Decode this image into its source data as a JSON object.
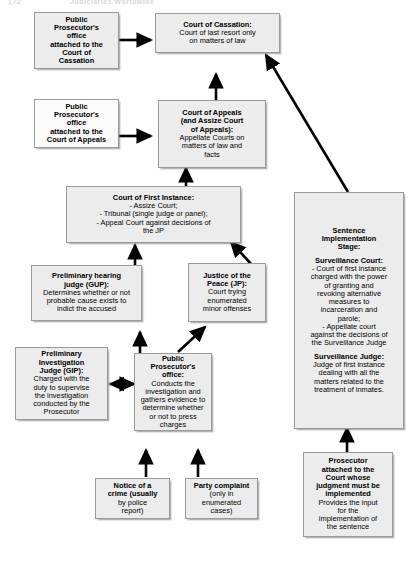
{
  "page": {
    "header_left": "172",
    "header_right": "Judiciaries Worldwide"
  },
  "boxes": [
    {
      "name": "public-prosecutor-cassation",
      "title": "Public Prosecutor's office attached to the Court of Cassation",
      "lines": [
        {
          "t": "Public",
          "b": true
        },
        {
          "t": "Prosecutor's",
          "b": true
        },
        {
          "t": "office",
          "b": true
        },
        {
          "t": "attached to the",
          "b": true
        },
        {
          "t": "Court of",
          "b": true
        },
        {
          "t": "Cassation",
          "b": true
        }
      ]
    },
    {
      "name": "court-of-cassation",
      "title": "Court of Cassation",
      "lines": [
        {
          "t": "Court of Cassation:",
          "b": true
        },
        {
          "t": "Court of last resort only",
          "b": false
        },
        {
          "t": "on matters of law",
          "b": false
        }
      ]
    },
    {
      "name": "public-prosecutor-appeals",
      "title": "Public Prosecutor's office attached to the Court of Appeals",
      "lines": [
        {
          "t": "Public",
          "b": true
        },
        {
          "t": "Prosecutor's",
          "b": true
        },
        {
          "t": "office",
          "b": true
        },
        {
          "t": "attached to the",
          "b": true
        },
        {
          "t": "Court of Appeals",
          "b": true
        }
      ]
    },
    {
      "name": "court-of-appeals",
      "title": "Court of Appeals",
      "lines": [
        {
          "t": "Court of Appeals",
          "b": true
        },
        {
          "t": "(and Assize Court",
          "b": true
        },
        {
          "t": "of Appeals):",
          "b": true
        },
        {
          "t": "Appellate Courts on",
          "b": false
        },
        {
          "t": "matters of law and",
          "b": false
        },
        {
          "t": "facts",
          "b": false
        }
      ]
    },
    {
      "name": "court-of-first-instance",
      "title": "Court of First Instance",
      "lines": [
        {
          "t": "Court of First Instance:",
          "b": true
        },
        {
          "t": "- Assize Court;",
          "b": false
        },
        {
          "t": "- Tribunal (single judge or panel);",
          "b": false
        },
        {
          "t": "- Appeal Court against decisions of",
          "b": false
        },
        {
          "t": "the JP",
          "b": false
        }
      ]
    },
    {
      "name": "preliminary-hearing-judge-gup",
      "title": "Preliminary hearing judge (GUP)",
      "lines": [
        {
          "t": "Preliminary hearing",
          "b": true
        },
        {
          "t": "judge (GUP):",
          "b": true
        },
        {
          "t": "Determines whether or not",
          "b": false
        },
        {
          "t": "probable cause exists to",
          "b": false
        },
        {
          "t": "indict the accused",
          "b": false
        }
      ]
    },
    {
      "name": "justice-of-the-peace",
      "title": "Justice of the Peace (JP)",
      "lines": [
        {
          "t": "Justice of the",
          "b": true
        },
        {
          "t": "Peace (JP):",
          "b": true
        },
        {
          "t": "Court trying",
          "b": false
        },
        {
          "t": "enumerated",
          "b": false
        },
        {
          "t": "minor offenses",
          "b": false
        }
      ]
    },
    {
      "name": "preliminary-investigation-judge-gip",
      "title": "Preliminary Investigation Judge (GIP)",
      "lines": [
        {
          "t": "Preliminary",
          "b": true
        },
        {
          "t": "Investigation",
          "b": true
        },
        {
          "t": "Judge (GIP):",
          "b": true
        },
        {
          "t": "Charged with the",
          "b": false
        },
        {
          "t": "duty to supervise",
          "b": false
        },
        {
          "t": "the investigation",
          "b": false
        },
        {
          "t": "conducted by the",
          "b": false
        },
        {
          "t": "Prosecutor",
          "b": false
        }
      ]
    },
    {
      "name": "public-prosecutors-office",
      "title": "Public Prosecutor's office",
      "lines": [
        {
          "t": "Public",
          "b": true
        },
        {
          "t": "Prosecutor's",
          "b": true
        },
        {
          "t": "office:",
          "b": true
        },
        {
          "t": "Conducts the",
          "b": false
        },
        {
          "t": "investigation and",
          "b": false
        },
        {
          "t": "gathers evidence to",
          "b": false
        },
        {
          "t": "determine whether",
          "b": false
        },
        {
          "t": "or not to press",
          "b": false
        },
        {
          "t": "charges",
          "b": false
        }
      ]
    },
    {
      "name": "notice-of-a-crime",
      "title": "Notice of a crime",
      "lines": [
        {
          "t": "Notice of a",
          "b": true
        },
        {
          "t": "crime (usually",
          "b": true
        },
        {
          "t": "by police",
          "b": false
        },
        {
          "t": "report)",
          "b": false
        }
      ]
    },
    {
      "name": "party-complaint",
      "title": "Party complaint",
      "lines": [
        {
          "t": "Party complaint",
          "b": true
        },
        {
          "t": "(only in",
          "b": false
        },
        {
          "t": "enumerated",
          "b": false
        },
        {
          "t": "cases)",
          "b": false
        }
      ]
    },
    {
      "name": "sentence-implementation-stage",
      "title": "Sentence Implementation Stage",
      "lines": [
        {
          "t": "Sentence",
          "b": true
        },
        {
          "t": "Implementation",
          "b": true
        },
        {
          "t": "Stage:",
          "b": true
        },
        {
          "t": "",
          "b": false
        },
        {
          "t": "Surveillance Court:",
          "b": true
        },
        {
          "t": "- Court of first instance",
          "b": false
        },
        {
          "t": "charged with the power",
          "b": false
        },
        {
          "t": "of granting and",
          "b": false
        },
        {
          "t": "revoking alternative",
          "b": false
        },
        {
          "t": "measures to",
          "b": false
        },
        {
          "t": "incarceration and",
          "b": false
        },
        {
          "t": "parole;",
          "b": false
        },
        {
          "t": "- Appellate court",
          "b": false
        },
        {
          "t": "against the decisions of",
          "b": false
        },
        {
          "t": "the Surveillance Judge",
          "b": false
        },
        {
          "t": "",
          "b": false
        },
        {
          "t": "Surveillance Judge:",
          "b": true
        },
        {
          "t": "Judge of first instance",
          "b": false
        },
        {
          "t": "dealing with all the",
          "b": false
        },
        {
          "t": "matters related to the",
          "b": false
        },
        {
          "t": "treatment of inmates.",
          "b": false
        }
      ]
    },
    {
      "name": "prosecutor-attached-to-court",
      "title": "Prosecutor attached to the Court whose judgment must be implemented",
      "lines": [
        {
          "t": "Prosecutor",
          "b": true
        },
        {
          "t": "attached to the",
          "b": true
        },
        {
          "t": "Court whose",
          "b": true
        },
        {
          "t": "judgment must be",
          "b": true
        },
        {
          "t": "implemented",
          "b": true
        },
        {
          "t": "Provides the input",
          "b": false
        },
        {
          "t": "for the",
          "b": false
        },
        {
          "t": "implementation of",
          "b": false
        },
        {
          "t": "the sentence",
          "b": false
        }
      ]
    }
  ],
  "connectors": [
    {
      "name": "arrow-prosecutor-cassation-to-cassation",
      "from": "public-prosecutor-cassation",
      "to": "court-of-cassation"
    },
    {
      "name": "arrow-prosecutor-appeals-to-appeals",
      "from": "public-prosecutor-appeals",
      "to": "court-of-appeals"
    },
    {
      "name": "arrow-appeals-to-cassation",
      "from": "court-of-appeals",
      "to": "court-of-cassation"
    },
    {
      "name": "arrow-first-instance-to-appeals",
      "from": "court-of-first-instance",
      "to": "court-of-appeals"
    },
    {
      "name": "arrow-gup-to-first-instance",
      "from": "preliminary-hearing-judge-gup",
      "to": "court-of-first-instance"
    },
    {
      "name": "arrow-jp-to-first-instance",
      "from": "justice-of-the-peace",
      "to": "court-of-first-instance"
    },
    {
      "name": "arrow-prosecutor-office-to-gup",
      "from": "public-prosecutors-office",
      "to": "preliminary-hearing-judge-gup"
    },
    {
      "name": "arrow-prosecutor-office-to-jp",
      "from": "public-prosecutors-office",
      "to": "justice-of-the-peace"
    },
    {
      "name": "arrow-gip-prosecutor-office-bidirectional",
      "from": "preliminary-investigation-judge-gip",
      "to": "public-prosecutors-office"
    },
    {
      "name": "arrow-notice-to-prosecutor-office",
      "from": "notice-of-a-crime",
      "to": "public-prosecutors-office"
    },
    {
      "name": "arrow-complaint-to-prosecutor-office",
      "from": "party-complaint",
      "to": "public-prosecutors-office"
    },
    {
      "name": "arrow-sentence-stage-to-cassation",
      "from": "sentence-implementation-stage",
      "to": "court-of-cassation"
    },
    {
      "name": "arrow-prosecutor-attached-to-sentence-stage",
      "from": "prosecutor-attached-to-court",
      "to": "sentence-implementation-stage"
    }
  ],
  "style": {
    "box_fill": "#ececec",
    "box_border": "#9a9a9a",
    "arrow_color": "#000000",
    "background": "#ffffff"
  }
}
